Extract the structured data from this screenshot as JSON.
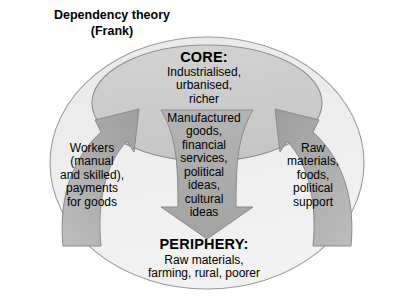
{
  "title": {
    "line1": "Dependency theory",
    "line2": "(Frank)",
    "text": "Dependency theory\n(Frank)"
  },
  "core": {
    "heading": "CORE:",
    "body": "Industrialised,\nurbanised,\nricher"
  },
  "periphery": {
    "heading": "PERIPHERY:",
    "body": "Raw materials,\nfarming, rural, poorer"
  },
  "flows": {
    "core_to_periphery": "Manufactured\ngoods,\nfinancial\nservices,\npolitical\nideas,\ncultural\nideas",
    "periphery_to_core_left": "Workers\n(manual\nand skilled),\npayments\nfor goods",
    "periphery_to_core_right": "Raw\nmaterials,\nfoods,\npolitical\nsupport"
  },
  "colors": {
    "background": "#ffffff",
    "outer_ellipse_fill": "#eeeeee",
    "outer_ellipse_stroke": "#9a9a9a",
    "core_ellipse_fill": "#cdcdcd",
    "core_ellipse_stroke": "#8e8e8e",
    "arrow_fill": "#a9a9a9",
    "arrow_stroke": "#8a8a8a",
    "text": "#000000"
  },
  "shapes": {
    "outer_ellipse": {
      "cx": 207,
      "cy": 163,
      "rx": 157,
      "ry": 126
    },
    "core_ellipse": {
      "cx": 207,
      "cy": 103,
      "rx": 115,
      "ry": 58
    },
    "down_arrow_label": "core-to-periphery-arrow",
    "left_arrow_label": "periphery-to-core-left-arrow",
    "right_arrow_label": "periphery-to-core-right-arrow"
  }
}
